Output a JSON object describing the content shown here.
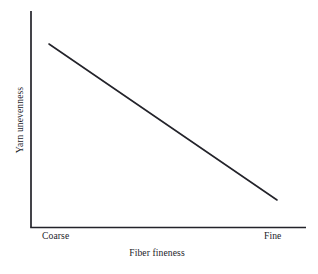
{
  "figure": {
    "background_color": "#ffffff",
    "ink_color": "#23232a",
    "width": 318,
    "height": 274
  },
  "chart_data": {
    "type": "line",
    "title": "",
    "subtitle": "",
    "xlabel": "Fiber fineness",
    "ylabel": "Yarn unevenness",
    "x_tick_labels": [
      "Coarse",
      "Fine"
    ],
    "y_tick_labels": [],
    "grid": false,
    "legend": false,
    "legend_position": "none",
    "annotations": [],
    "xlim": [
      0,
      1
    ],
    "ylim": [
      0,
      1
    ],
    "x": [
      0.08,
      1.0
    ],
    "series": [
      {
        "name": "Yarn unevenness vs fiber fineness",
        "values": [
          0.85,
          0.13
        ],
        "color": "#23232a",
        "line_width": 1.6,
        "marker": "none",
        "style": "solid"
      }
    ],
    "axis_geometry": {
      "y_axis_x": 31,
      "y_axis_top": 11,
      "y_axis_bottom": 227.5,
      "x_axis_y": 227.5,
      "x_axis_left": 31,
      "x_axis_right": 306,
      "line_start": [
        49,
        44
      ],
      "line_end": [
        277,
        200
      ]
    }
  },
  "axis_titles": {
    "x": "Fiber fineness",
    "y": "Yarn unevenness"
  },
  "x_ticks": {
    "left_label": "Coarse",
    "right_label": "Fine"
  }
}
